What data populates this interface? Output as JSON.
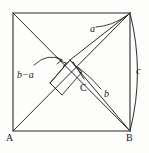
{
  "figure": {
    "background_color": "#fdfdfc",
    "stroke_color": "#2b2b2b",
    "square": {
      "top_left": [
        13,
        13
      ],
      "top_right": [
        130,
        13
      ],
      "bottom_right": [
        130,
        131
      ],
      "bottom_left": [
        13,
        131
      ]
    },
    "points": {
      "A": [
        13,
        131
      ],
      "B": [
        130,
        131
      ],
      "C": [
        78,
        78
      ],
      "center_node": [
        70,
        60
      ],
      "right_angle_marker_corner": [
        57,
        72
      ]
    }
  },
  "labels": {
    "vertex_a": "A",
    "vertex_b": "B",
    "vertex_c": "C",
    "side_a": "a",
    "side_b": "b",
    "side_c": "c",
    "segment_b_minus_a": "b−a"
  },
  "label_positions": {
    "vertex_a": {
      "x": 6,
      "y": 133
    },
    "vertex_b": {
      "x": 126,
      "y": 133
    },
    "vertex_c": {
      "x": 80,
      "y": 83
    },
    "side_a": {
      "x": 90,
      "y": 24
    },
    "side_b": {
      "x": 104,
      "y": 89
    },
    "side_c": {
      "x": 136,
      "y": 66
    },
    "segment_b_minus_a": {
      "x": 17,
      "y": 70
    }
  },
  "font_sizes": {
    "vertex": 10,
    "segment": 10
  }
}
